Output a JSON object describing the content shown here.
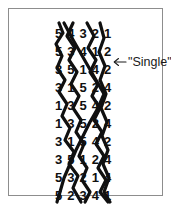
{
  "figure": {
    "type": "braid-permutation-diagram",
    "border_color": "#8d8d8d",
    "ink_color": "#101010",
    "background": "#ffffff"
  },
  "annotation": {
    "arrow_icon": "arrow-left-icon",
    "label": "\"Single\"",
    "points_to_row_index": 2
  },
  "braid": {
    "columns": 5,
    "rows": 10,
    "strand_color": "#101010",
    "strand_width": 3,
    "rows_data": [
      {
        "index": 0,
        "digits": [
          "5",
          "4",
          "3",
          "2",
          "1"
        ]
      },
      {
        "index": 1,
        "digits": [
          "5",
          "3",
          "4",
          "1",
          "2"
        ]
      },
      {
        "index": 2,
        "digits": [
          "3",
          "5",
          "1",
          "4",
          "2"
        ]
      },
      {
        "index": 3,
        "digits": [
          "3",
          "1",
          "5",
          "2",
          "4"
        ]
      },
      {
        "index": 4,
        "digits": [
          "1",
          "3",
          "5",
          "4",
          "2"
        ]
      },
      {
        "index": 5,
        "digits": [
          "1",
          "3",
          "5",
          "2",
          "4"
        ]
      },
      {
        "index": 6,
        "digits": [
          "3",
          "1",
          "5",
          "4",
          "2"
        ]
      },
      {
        "index": 7,
        "digits": [
          "3",
          "5",
          "1",
          "2",
          "4"
        ]
      },
      {
        "index": 8,
        "digits": [
          "5",
          "3",
          "2",
          "1",
          "4"
        ]
      },
      {
        "index": 9,
        "digits": [
          "5",
          "2",
          "3",
          "4",
          "1"
        ]
      }
    ],
    "strand_paths": [
      {
        "name": "strand-a",
        "points": "5,4 9,14 2,24 8,36 3,48 11,60 5,72 13,84 8,96 16,108 11,120 20,132 15,144 24,156 19,168 27,180"
      },
      {
        "name": "strand-b",
        "points": "19,4 13,16 21,28 15,40 23,52 17,64 25,76 19,88 27,100 22,112 30,124 25,136 33,148 28,160 36,172 31,182"
      },
      {
        "name": "strand-c",
        "points": "33,4 40,16 34,28 42,40 36,52 44,64 38,76 46,88 40,100 48,112 42,124 50,136 44,148 52,160 46,172 54,182"
      },
      {
        "name": "strand-d",
        "points": "46,4 50,18 45,32 51,46 46,60 52,74 47,88 53,102 48,116 54,130 49,144 55,158 50,172 56,182"
      },
      {
        "name": "strand-e",
        "points": "10,4 18,18 26,32 34,46 42,60 50,74 44,88 36,102 29,116 22,130 16,144 10,158 6,172 3,182"
      }
    ]
  }
}
